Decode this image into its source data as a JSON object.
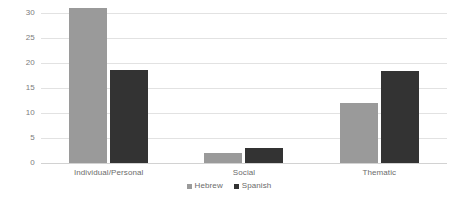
{
  "chart_data": {
    "type": "bar",
    "title": "",
    "subtitle": "",
    "xlabel": "",
    "ylabel": "",
    "categories": [
      "Individual/Personal",
      "Social",
      "Thematic"
    ],
    "series": [
      {
        "name": "Hebrew",
        "color": "#9a9a9a",
        "values": [
          31,
          2,
          12
        ]
      },
      {
        "name": "Spanish",
        "color": "#333333",
        "values": [
          18.7,
          3,
          18.5
        ]
      }
    ],
    "ylim": [
      0,
      30
    ],
    "yticks": [
      0,
      5,
      10,
      15,
      20,
      25,
      30
    ],
    "ytick_labels": [
      "0",
      "5",
      "10",
      "15",
      "20",
      "25",
      "30"
    ],
    "grid": true,
    "grid_axis": "y",
    "legend": {
      "position": "bottom",
      "entries": [
        "Hebrew",
        "Spanish"
      ]
    },
    "background_color": "#ffffff",
    "gridline_color": "#e2e2e2",
    "axis_text_color": "#6b6b6b"
  }
}
